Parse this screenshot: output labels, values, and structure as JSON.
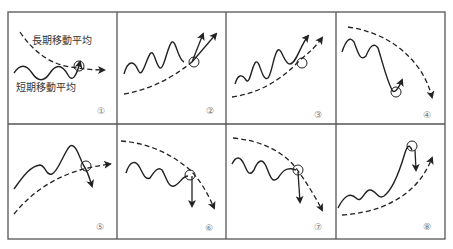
{
  "diagram": {
    "type": "moving-average-signal-patterns",
    "layout": {
      "rows": 2,
      "cols": 4
    },
    "colors": {
      "line": "#2a2a2a",
      "frame": "#555555",
      "number": "#777777",
      "background": "#ffffff"
    },
    "legend": {
      "long_term": "長期移動平均",
      "short_term": "短期移動平均"
    },
    "panels": [
      {
        "number": "①",
        "long_ma": "flattening-after-decline",
        "short_ma": "crosses-above",
        "signal": "buy"
      },
      {
        "number": "②",
        "long_ma": "rising",
        "short_ma": "dip-and-rebound-above",
        "signal": "buy"
      },
      {
        "number": "③",
        "long_ma": "rising",
        "short_ma": "touch-and-rebound",
        "signal": "buy"
      },
      {
        "number": "④",
        "long_ma": "falling",
        "short_ma": "sharp-drop-below-rebound",
        "signal": "buy"
      },
      {
        "number": "⑤",
        "long_ma": "flattening-after-rise",
        "short_ma": "crosses-below",
        "signal": "sell"
      },
      {
        "number": "⑥",
        "long_ma": "falling",
        "short_ma": "rise-and-fall-back",
        "signal": "sell"
      },
      {
        "number": "⑦",
        "long_ma": "falling",
        "short_ma": "touch-and-drop",
        "signal": "sell"
      },
      {
        "number": "⑧",
        "long_ma": "rising",
        "short_ma": "sharp-rise-above-pullback",
        "signal": "sell"
      }
    ]
  }
}
